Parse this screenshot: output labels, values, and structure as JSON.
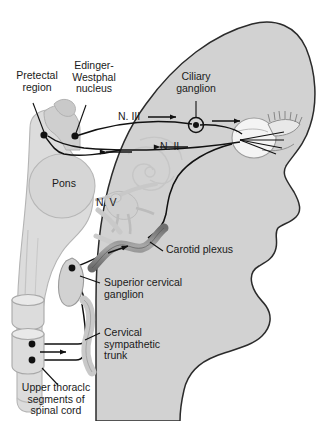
{
  "figure": {
    "background_color": "#ffffff",
    "head_fill": "#d2d2d2",
    "head_stroke": "#2b2b2b",
    "brain_fill": "#dcdcdc",
    "nerve_stroke": "#111111",
    "plexus_fill": "#8c8c8c"
  },
  "labels": {
    "pretectal_region": "Pretectal\nregion",
    "edinger_westphal": "Edinger-\nWestphal\nnucleus",
    "ciliary_ganglion": "Ciliary\nganglion",
    "nerve_three": "N. III",
    "nerve_two": "N. II",
    "nerve_five": "N. V",
    "pons": "Pons",
    "carotid_plexus": "Carotid plexus",
    "superior_cervical_ganglion": "Superior cervical\nganglion",
    "cervical_sympathetic_trunk": "Cervical\nsympathetic\ntrunk",
    "upper_thoracic": "Upper thoraclc\nsegments of\nspinal cord"
  },
  "structures": [
    {
      "name": "pretectal-region-node",
      "type": "node",
      "x": 44,
      "y": 135
    },
    {
      "name": "edinger-westphal-node",
      "type": "node",
      "x": 75,
      "y": 136
    },
    {
      "name": "ciliary-ganglion-node",
      "type": "ring",
      "x": 196,
      "y": 125
    },
    {
      "name": "superior-cervical-ganglion-node",
      "type": "node",
      "x": 72,
      "y": 268
    },
    {
      "name": "thoracic-upper-node",
      "type": "node",
      "x": 32,
      "y": 344
    },
    {
      "name": "thoracic-lower-node",
      "type": "node",
      "x": 32,
      "y": 360
    }
  ],
  "arrows": [
    {
      "name": "arrow-n3-efferent",
      "direction": "right"
    },
    {
      "name": "arrow-ciliary-to-eye",
      "direction": "right"
    },
    {
      "name": "arrow-n2-afferent",
      "direction": "left"
    },
    {
      "name": "arrow-midbrain-inflow",
      "direction": "left"
    },
    {
      "name": "arrow-carotid-ascending",
      "direction": "right"
    },
    {
      "name": "arrow-thoracic-outflow",
      "direction": "right"
    }
  ]
}
